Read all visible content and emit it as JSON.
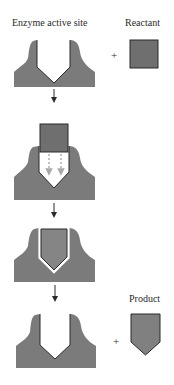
{
  "labels": {
    "enzyme_active_site": "Enzyme active site",
    "reactant": "Reactant",
    "product": "Product",
    "plus_top": "+",
    "plus_bottom": "+"
  },
  "colors": {
    "enzyme_fill": "#7b7b7b",
    "reactant_fill": "#6f6f6f",
    "product_fill": "#808080",
    "outline": "#2a2a2a",
    "dashed_arrow": "#b8b8b8",
    "background": "#ffffff"
  },
  "steps": [
    {
      "stage": 1,
      "description": "Enzyme with empty active site plus reactant"
    },
    {
      "stage": 2,
      "description": "Reactant approaches active site"
    },
    {
      "stage": 3,
      "description": "Reactant bound and reshaped in active site"
    },
    {
      "stage": 4,
      "description": "Enzyme released plus product"
    }
  ]
}
